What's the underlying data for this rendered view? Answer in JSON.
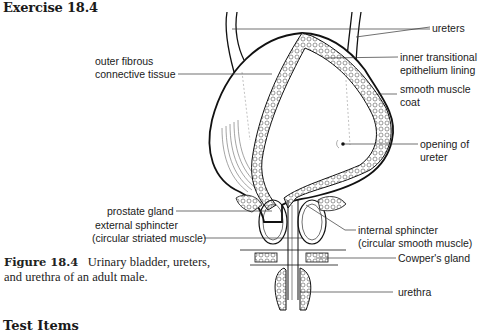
{
  "heading": "Exercise 18.4",
  "figure": {
    "number": "Figure 18.4",
    "caption_line1": "Urinary bladder, ureters,",
    "caption_line2": "and urethra of an adult male."
  },
  "labels": {
    "ureters": "ureters",
    "outer_fibrous_1": "outer fibrous",
    "outer_fibrous_2": "connective tissue",
    "inner_transitional_1": "inner transitional",
    "inner_transitional_2": "epithelium lining",
    "smooth_muscle_1": "smooth muscle",
    "smooth_muscle_2": "coat",
    "opening_1": "opening of",
    "opening_2": "ureter",
    "prostate": "prostate gland",
    "external_sphincter_1": "external sphincter",
    "external_sphincter_2": "(circular striated muscle)",
    "internal_sphincter_1": "internal sphincter",
    "internal_sphincter_2": "(circular smooth muscle)",
    "cowpers": "Cowper's gland",
    "urethra": "urethra"
  },
  "footer_heading": "Test Items"
}
